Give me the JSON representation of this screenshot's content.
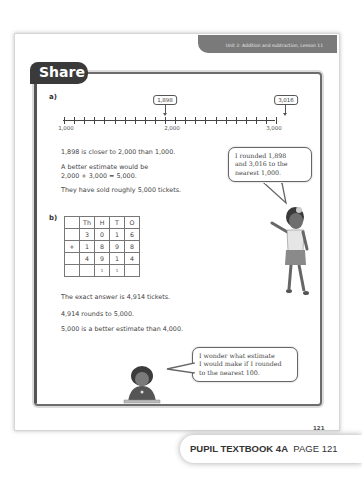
{
  "header": {
    "unit_title": "Unit 2: Addition and subtraction, Lesson 11"
  },
  "section": {
    "title": "Share"
  },
  "part_a": {
    "label": "a)",
    "number_line": {
      "start": "1,000",
      "mid": "2,000",
      "end": "3,000",
      "markers": [
        {
          "label": "1,898"
        },
        {
          "label": "3,016"
        }
      ]
    },
    "lines": [
      "1,898 is closer to 2,000 than 1,000.",
      "A better estimate would be",
      "2,000 + 3,000 = 5,000.",
      "They have sold roughly 5,000 tickets."
    ],
    "speech": [
      "I rounded 1,898",
      "and 3,016 to the",
      "nearest 1,000."
    ]
  },
  "part_b": {
    "label": "b)",
    "table": {
      "headers": [
        "",
        "Th",
        "H",
        "T",
        "O"
      ],
      "rows": [
        [
          "",
          "3",
          "0",
          "1",
          "6"
        ],
        [
          "+",
          "1",
          "8",
          "9",
          "8"
        ],
        [
          "",
          "4",
          "9",
          "1",
          "4"
        ],
        [
          "",
          "",
          "1",
          "1",
          ""
        ]
      ]
    },
    "lines": [
      "The exact answer is 4,914 tickets.",
      "4,914 rounds to 5,000.",
      "5,000 is a better estimate than 4,000."
    ],
    "speech": [
      "I wonder what estimate",
      "I would make if I rounded",
      "to the nearest 100."
    ]
  },
  "page_number": "121",
  "footer": {
    "book": "PUPIL TEXTBOOK 4A",
    "page": "PAGE 121"
  }
}
